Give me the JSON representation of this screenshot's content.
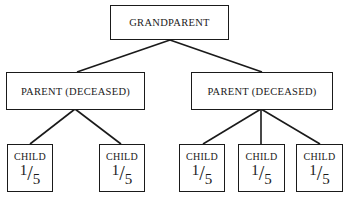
{
  "diagram": {
    "grandparent": {
      "label": "GRANDPARENT"
    },
    "parents": [
      {
        "label": "PARENT (DECEASED)",
        "children": [
          {
            "label": "CHILD",
            "share_num": "1",
            "share_den": "5"
          },
          {
            "label": "CHILD",
            "share_num": "1",
            "share_den": "5"
          }
        ]
      },
      {
        "label": "PARENT (DECEASED)",
        "children": [
          {
            "label": "CHILD",
            "share_num": "1",
            "share_den": "5"
          },
          {
            "label": "CHILD",
            "share_num": "1",
            "share_den": "5"
          },
          {
            "label": "CHILD",
            "share_num": "1",
            "share_den": "5"
          }
        ]
      }
    ]
  }
}
